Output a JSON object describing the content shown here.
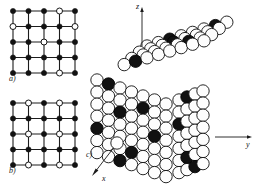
{
  "figure": {
    "panels": [
      {
        "id": "a",
        "label": "a)",
        "type": "2d-lattice"
      },
      {
        "id": "b",
        "label": "b)",
        "type": "2d-lattice"
      },
      {
        "id": "c",
        "label": "c)",
        "type": "3d-sphere-packing"
      }
    ],
    "axes": {
      "z": "z",
      "y": "y",
      "x": "x"
    },
    "caption": ""
  },
  "lattice_a": {
    "rows": 5,
    "cols": 5,
    "filled_color": "#121212",
    "open_color": "#ffffff",
    "nodes": [
      [
        "filled",
        "filled",
        "filled",
        "open",
        "filled"
      ],
      [
        "open",
        "filled",
        "filled",
        "filled",
        "open"
      ],
      [
        "filled",
        "filled",
        "open",
        "filled",
        "filled"
      ],
      [
        "filled",
        "filled",
        "filled",
        "filled",
        "filled"
      ],
      [
        "filled",
        "filled",
        "filled",
        "open",
        "filled"
      ]
    ]
  },
  "lattice_b": {
    "rows": 5,
    "cols": 5,
    "filled_color": "#121212",
    "open_color": "#ffffff",
    "nodes": [
      [
        "filled",
        "open",
        "filled",
        "open",
        "filled"
      ],
      [
        "filled",
        "filled",
        "filled",
        "filled",
        "filled"
      ],
      [
        "filled",
        "open",
        "filled",
        "open",
        "filled"
      ],
      [
        "filled",
        "filled",
        "filled",
        "filled",
        "filled"
      ],
      [
        "filled",
        "open",
        "filled",
        "open",
        "filled"
      ]
    ]
  },
  "cube_c": {
    "sphere_light": "#fdfdfd",
    "sphere_dark": "#111111",
    "outline": "#101010",
    "top_face": {
      "rows": 4,
      "cols": 8,
      "dark_cells": [
        [
          0,
          2
        ],
        [
          0,
          6
        ],
        [
          1,
          3
        ],
        [
          2,
          5
        ],
        [
          3,
          1
        ]
      ]
    },
    "front_face": {
      "rows": 7,
      "cols": 7,
      "dark_cells": [
        [
          0,
          1
        ],
        [
          1,
          4
        ],
        [
          2,
          2
        ],
        [
          3,
          5
        ],
        [
          4,
          0
        ],
        [
          5,
          3
        ],
        [
          6,
          2
        ]
      ]
    },
    "right_face": {
      "rows": 7,
      "cols": 4,
      "dark_cells": [
        [
          0,
          1
        ],
        [
          2,
          0
        ],
        [
          5,
          1
        ],
        [
          6,
          2
        ]
      ]
    }
  }
}
